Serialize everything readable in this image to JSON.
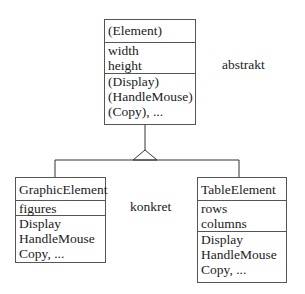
{
  "diagram": {
    "abstract_class": {
      "name": "(Element)",
      "attributes": [
        "width",
        "height"
      ],
      "operations": [
        "(Display)",
        "(HandleMouse)",
        "(Copy), ..."
      ]
    },
    "abstract_label": "abstrakt",
    "concrete_label": "konkret",
    "concrete_classes": [
      {
        "name": "GraphicElement",
        "attributes": [
          "figures"
        ],
        "operations": [
          "Display",
          "HandleMouse",
          "Copy, ..."
        ]
      },
      {
        "name": "TableElement",
        "attributes": [
          "rows",
          "columns"
        ],
        "operations": [
          "Display",
          "HandleMouse",
          "Copy, ..."
        ]
      }
    ],
    "relationship": "generalization"
  }
}
